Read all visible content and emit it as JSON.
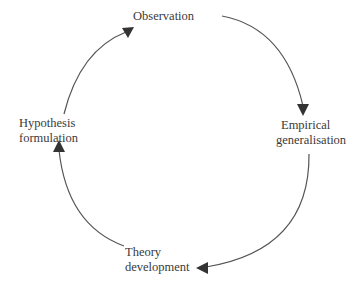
{
  "diagram": {
    "type": "cycle",
    "direction": "clockwise",
    "nodes": [
      {
        "id": "observation",
        "lines": [
          "Observation"
        ]
      },
      {
        "id": "empirical_generalisation",
        "lines": [
          "Empirical",
          "generalisation"
        ]
      },
      {
        "id": "theory_development",
        "lines": [
          "Theory",
          "development"
        ]
      },
      {
        "id": "hypothesis_formulation",
        "lines": [
          "Hypothesis",
          "formulation"
        ]
      }
    ],
    "edges": [
      {
        "from": "observation",
        "to": "empirical_generalisation"
      },
      {
        "from": "empirical_generalisation",
        "to": "theory_development"
      },
      {
        "from": "theory_development",
        "to": "hypothesis_formulation"
      },
      {
        "from": "hypothesis_formulation",
        "to": "observation"
      }
    ]
  },
  "colors": {
    "line": "#555555",
    "arrowhead": "#333333",
    "text": "#3a3a3a",
    "background": "#ffffff"
  }
}
